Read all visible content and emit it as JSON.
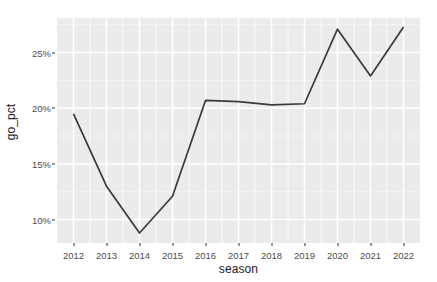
{
  "chart_data": {
    "type": "line",
    "title": "",
    "subtitle": "",
    "xlabel": "season",
    "ylabel": "go_pct",
    "x": [
      2012,
      2013,
      2014,
      2015,
      2016,
      2017,
      2018,
      2019,
      2020,
      2021,
      2022
    ],
    "categories": [
      "2012",
      "2013",
      "2014",
      "2015",
      "2016",
      "2017",
      "2018",
      "2019",
      "2020",
      "2021",
      "2022"
    ],
    "values": [
      19.5,
      13.0,
      8.8,
      12.1,
      20.7,
      20.6,
      20.3,
      20.4,
      27.1,
      22.9,
      27.3
    ],
    "series": [
      {
        "name": "go_pct",
        "values": [
          19.5,
          13.0,
          8.8,
          12.1,
          20.7,
          20.6,
          20.3,
          20.4,
          27.1,
          22.9,
          27.3
        ]
      }
    ],
    "y_tick_values": [
      10,
      15,
      20,
      25
    ],
    "y_tick_labels": [
      "10%",
      "15%",
      "20%",
      "25%"
    ],
    "x_tick_values": [
      2012,
      2013,
      2014,
      2015,
      2016,
      2017,
      2018,
      2019,
      2020,
      2021,
      2022
    ],
    "x_tick_labels": [
      "2012",
      "2013",
      "2014",
      "2015",
      "2016",
      "2017",
      "2018",
      "2019",
      "2020",
      "2021",
      "2022"
    ],
    "ylim": [
      7.9,
      28.1
    ],
    "xlim": [
      2011.5,
      2022.5
    ],
    "grid": true,
    "legend": "none",
    "legend_position": "none",
    "annotations": []
  },
  "style": {
    "panel_background": "#ebebeb",
    "major_gridline_color": "#ffffff",
    "minor_gridline_color": "#f5f5f5",
    "line_color": "#3a3a3a",
    "line_width": 1.7,
    "axis_text_color": "#4d4d4d",
    "axis_title_color": "#1a1a1a",
    "plot_background": "#ffffff",
    "tick_mark_color": "#333333"
  }
}
